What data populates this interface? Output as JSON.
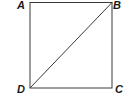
{
  "diagram": {
    "type": "geometry",
    "shape": "square",
    "vertices": [
      {
        "label": "A",
        "position": "top-left"
      },
      {
        "label": "B",
        "position": "top-right"
      },
      {
        "label": "C",
        "position": "bottom-right"
      },
      {
        "label": "D",
        "position": "bottom-left"
      }
    ],
    "segments": [
      "AB",
      "BC",
      "CD",
      "DA",
      "DB"
    ],
    "diagonal": "DB",
    "line_color": "#3a3a3a"
  }
}
